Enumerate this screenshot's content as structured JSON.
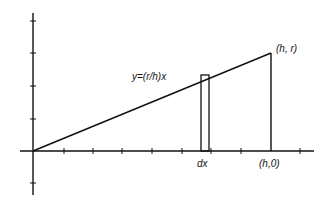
{
  "diagram": {
    "type": "graph-of-line-with-slice",
    "colors": {
      "stroke": "#111111",
      "background": "#ffffff"
    },
    "axes": {
      "origin_px": [
        33,
        151
      ],
      "x_axis": {
        "from_px": 20,
        "to_px": 314,
        "tick_spacing_px": 29.7,
        "tick_count": 10
      },
      "y_axis": {
        "from_px": 13,
        "to_px": 195,
        "tick_spacing_px": 32.5,
        "ticks_above": 4,
        "ticks_below": 1
      }
    },
    "line": {
      "equation_label": "y=(r/h)x",
      "from_px": [
        33,
        151
      ],
      "to_px": [
        271,
        53
      ]
    },
    "endpoint_top": {
      "label": "(h, r)"
    },
    "endpoint_bottom": {
      "label": "(h,0)"
    },
    "vertical_segment": {
      "x_px": 271,
      "from_y_px": 53,
      "to_y_px": 151
    },
    "slice_rect": {
      "label": "dx",
      "x_px": 201,
      "y_px": 75,
      "width_px": 8,
      "height_px": 76
    }
  }
}
